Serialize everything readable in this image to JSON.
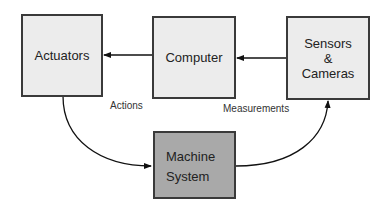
{
  "diagram": {
    "nodes": [
      {
        "id": "actuators",
        "label": "Actuators"
      },
      {
        "id": "computer",
        "label": "Computer"
      },
      {
        "id": "sensors",
        "label_lines": [
          "Sensors",
          "&",
          "Cameras"
        ]
      },
      {
        "id": "machine",
        "label_lines": [
          "Machine",
          "System"
        ]
      }
    ],
    "edges": [
      {
        "from": "computer",
        "to": "actuators",
        "label": ""
      },
      {
        "from": "sensors",
        "to": "computer",
        "label": ""
      },
      {
        "from": "actuators",
        "to": "machine",
        "label": "Actions"
      },
      {
        "from": "machine",
        "to": "sensors",
        "label": "Measurements"
      }
    ],
    "edge_labels": {
      "actions": "Actions",
      "measurements": "Measurements"
    },
    "colors": {
      "box_fill": "#ececec",
      "machine_fill": "#a9a9a9",
      "stroke": "#3a3a3a"
    }
  }
}
